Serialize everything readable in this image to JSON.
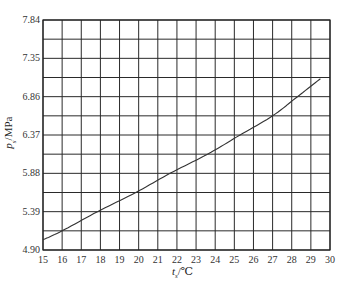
{
  "chart_data": {
    "type": "line",
    "title": "",
    "xlabel": "t_s/℃",
    "ylabel": "p_s/MPa",
    "xlim": [
      15,
      30
    ],
    "ylim": [
      4.9,
      7.84
    ],
    "x_ticks": [
      "15",
      "16",
      "17",
      "18",
      "19",
      "20",
      "21",
      "22",
      "23",
      "24",
      "25",
      "26",
      "27",
      "28",
      "29",
      "30"
    ],
    "y_ticks": [
      "7.84",
      "7.35",
      "6.86",
      "6.37",
      "5.88",
      "5.39",
      "4.90"
    ],
    "grid": true,
    "y_minor_grid_step": 0.245,
    "legend": null,
    "series": [
      {
        "name": "saturation pressure",
        "x": [
          15.0,
          16.0,
          17.85,
          19.85,
          21.64,
          23.6,
          25.3,
          27.0,
          28.3,
          29.5
        ],
        "values": [
          5.03,
          5.145,
          5.39,
          5.635,
          5.88,
          6.125,
          6.37,
          6.615,
          6.86,
          7.09
        ]
      }
    ]
  },
  "labels": {
    "x_var": "t",
    "x_sub": "s",
    "x_unit": "/℃",
    "y_var": "p",
    "y_sub": "s",
    "y_unit": "/MPa"
  },
  "colors": {
    "grid": "#2a2a2a",
    "line": "#333333"
  }
}
